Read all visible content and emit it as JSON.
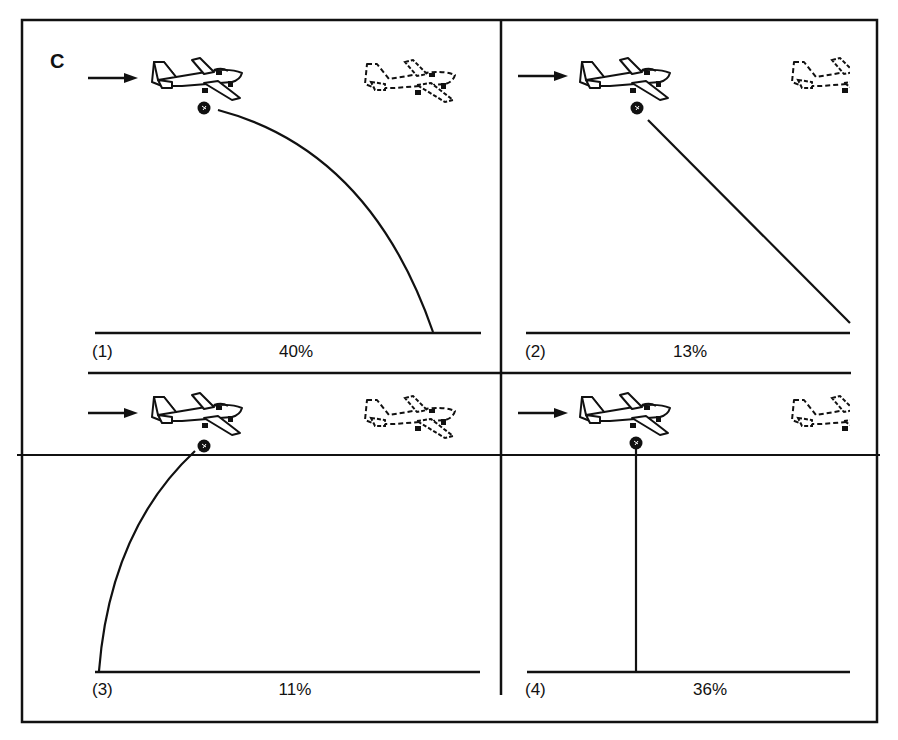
{
  "figure": {
    "letter": "C",
    "panels": [
      {
        "label": "(1)",
        "percent": "40%",
        "trajectory": "forward-curving parabola"
      },
      {
        "label": "(2)",
        "percent": "13%",
        "trajectory": "straight diagonal forward"
      },
      {
        "label": "(3)",
        "percent": "11%",
        "trajectory": "backward-curving arc"
      },
      {
        "label": "(4)",
        "percent": "36%",
        "trajectory": "straight vertical drop"
      }
    ]
  },
  "colors": {
    "ink": "#111111",
    "background": "#ffffff"
  },
  "icons": {
    "motion_arrow": "arrow-right-icon",
    "airplane_solid": "airplane-icon",
    "airplane_ghost": "airplane-dashed-icon",
    "ball": "ball-icon"
  }
}
